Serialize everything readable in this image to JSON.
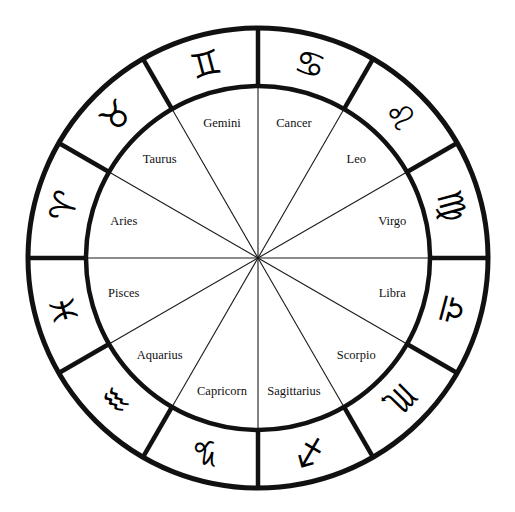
{
  "diagram": {
    "type": "zodiac-wheel",
    "geometry": {
      "center_x": 258,
      "center_y": 258,
      "outer_radius": 230,
      "inner_radius": 172,
      "glyph_radius": 201,
      "label_radius": 139,
      "sector_count": 12,
      "sector_degrees": 30
    },
    "colors": {
      "background": "#ffffff",
      "stroke": "#111111",
      "glyph": "#000000",
      "label": "#111111"
    },
    "signs": [
      {
        "name": "Capricorn",
        "glyph": "♑",
        "icon": "capricorn-icon",
        "start_angle": 240,
        "mid_angle": 255
      },
      {
        "name": "Aquarius",
        "glyph": "♒",
        "icon": "aquarius-icon",
        "start_angle": 210,
        "mid_angle": 225
      },
      {
        "name": "Pisces",
        "glyph": "♓",
        "icon": "pisces-icon",
        "start_angle": 180,
        "mid_angle": 195
      },
      {
        "name": "Aries",
        "glyph": "♈",
        "icon": "aries-icon",
        "start_angle": 150,
        "mid_angle": 165
      },
      {
        "name": "Taurus",
        "glyph": "♉",
        "icon": "taurus-icon",
        "start_angle": 120,
        "mid_angle": 135
      },
      {
        "name": "Gemini",
        "glyph": "♊",
        "icon": "gemini-icon",
        "start_angle": 90,
        "mid_angle": 105
      },
      {
        "name": "Cancer",
        "glyph": "♋",
        "icon": "cancer-icon",
        "start_angle": 60,
        "mid_angle": 75
      },
      {
        "name": "Leo",
        "glyph": "♌",
        "icon": "leo-icon",
        "start_angle": 30,
        "mid_angle": 45
      },
      {
        "name": "Virgo",
        "glyph": "♍",
        "icon": "virgo-icon",
        "start_angle": 0,
        "mid_angle": 15
      },
      {
        "name": "Libra",
        "glyph": "♎",
        "icon": "libra-icon",
        "start_angle": 330,
        "mid_angle": 345
      },
      {
        "name": "Scorpio",
        "glyph": "♏",
        "icon": "scorpio-icon",
        "start_angle": 300,
        "mid_angle": 315
      },
      {
        "name": "Sagittarius",
        "glyph": "♐",
        "icon": "sagittarius-icon",
        "start_angle": 270,
        "mid_angle": 285
      }
    ]
  }
}
